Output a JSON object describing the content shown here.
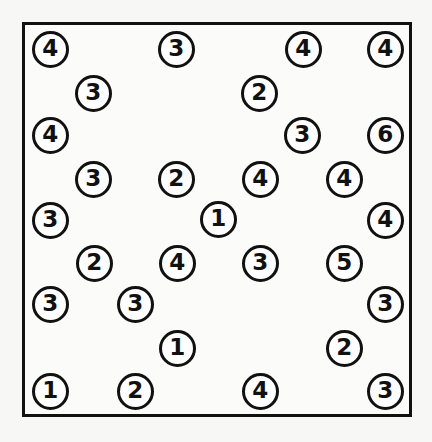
{
  "figure": {
    "name": "numbered-circle-grid",
    "background_color": "#f7f7f6",
    "panel_color": "#fbfbfa",
    "stroke_color": "#111111",
    "text_color": "#111111",
    "circle_fill": "#fefefe"
  },
  "frame": {
    "x": 22,
    "y": 22,
    "width": 390,
    "height": 395,
    "border_width": 3
  },
  "token_style": {
    "diameter": 37,
    "border_width": 3,
    "font_size": 23
  },
  "chart_data": {
    "type": "scatter",
    "title": "",
    "xlabel": "",
    "ylabel": "",
    "grid": false,
    "legend": null,
    "xlim": [
      22,
      412
    ],
    "ylim": [
      22,
      417
    ],
    "marker": "circle-outline-with-digit",
    "count": 31,
    "value_counts": {
      "1": 3,
      "2": 6,
      "3": 11,
      "4": 9,
      "5": 1,
      "6": 1
    },
    "points": [
      {
        "id": "p01",
        "label": "4",
        "x": 50,
        "y": 49
      },
      {
        "id": "p02",
        "label": "3",
        "x": 176,
        "y": 49
      },
      {
        "id": "p03",
        "label": "4",
        "x": 303,
        "y": 49
      },
      {
        "id": "p04",
        "label": "4",
        "x": 385,
        "y": 49
      },
      {
        "id": "p05",
        "label": "3",
        "x": 93,
        "y": 93
      },
      {
        "id": "p06",
        "label": "2",
        "x": 259,
        "y": 93
      },
      {
        "id": "p07",
        "label": "4",
        "x": 50,
        "y": 135
      },
      {
        "id": "p08",
        "label": "3",
        "x": 302,
        "y": 135
      },
      {
        "id": "p09",
        "label": "6",
        "x": 385,
        "y": 135
      },
      {
        "id": "p10",
        "label": "3",
        "x": 93,
        "y": 179
      },
      {
        "id": "p11",
        "label": "2",
        "x": 176,
        "y": 179
      },
      {
        "id": "p12",
        "label": "4",
        "x": 260,
        "y": 179
      },
      {
        "id": "p13",
        "label": "4",
        "x": 344,
        "y": 179
      },
      {
        "id": "p14",
        "label": "3",
        "x": 50,
        "y": 220
      },
      {
        "id": "p15",
        "label": "1",
        "x": 218,
        "y": 219
      },
      {
        "id": "p16",
        "label": "4",
        "x": 385,
        "y": 220
      },
      {
        "id": "p17",
        "label": "2",
        "x": 94,
        "y": 263
      },
      {
        "id": "p18",
        "label": "4",
        "x": 177,
        "y": 263
      },
      {
        "id": "p19",
        "label": "3",
        "x": 260,
        "y": 263
      },
      {
        "id": "p20",
        "label": "5",
        "x": 344,
        "y": 263
      },
      {
        "id": "p21",
        "label": "3",
        "x": 50,
        "y": 304
      },
      {
        "id": "p22",
        "label": "3",
        "x": 135,
        "y": 304
      },
      {
        "id": "p23",
        "label": "3",
        "x": 385,
        "y": 304
      },
      {
        "id": "p24",
        "label": "1",
        "x": 177,
        "y": 348
      },
      {
        "id": "p25",
        "label": "2",
        "x": 344,
        "y": 348
      },
      {
        "id": "p26",
        "label": "1",
        "x": 50,
        "y": 391
      },
      {
        "id": "p27",
        "label": "2",
        "x": 135,
        "y": 391
      },
      {
        "id": "p28",
        "label": "4",
        "x": 260,
        "y": 391
      },
      {
        "id": "p29",
        "label": "3",
        "x": 385,
        "y": 391
      }
    ]
  }
}
